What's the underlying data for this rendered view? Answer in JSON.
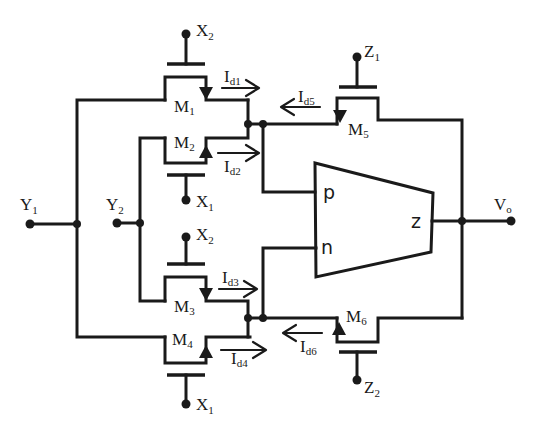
{
  "diagram": {
    "type": "circuit-schematic",
    "background": "#ffffff",
    "stroke_color": "#1a1a1a",
    "block": {
      "name": "Current Conveyor / OTA block",
      "ports": {
        "p": "p",
        "n": "n",
        "z": "z"
      }
    },
    "transistors": [
      {
        "id": "M1",
        "base": "M",
        "sub": "1",
        "gate": {
          "base": "X",
          "sub": "2"
        },
        "current": {
          "base": "I",
          "sub": "d1",
          "direction": "right"
        }
      },
      {
        "id": "M2",
        "base": "M",
        "sub": "2",
        "gate": {
          "base": "X",
          "sub": "1"
        },
        "current": {
          "base": "I",
          "sub": "d2",
          "direction": "right"
        }
      },
      {
        "id": "M3",
        "base": "M",
        "sub": "3",
        "gate": {
          "base": "X",
          "sub": "2"
        },
        "current": {
          "base": "I",
          "sub": "d3",
          "direction": "right"
        }
      },
      {
        "id": "M4",
        "base": "M",
        "sub": "4",
        "gate": {
          "base": "X",
          "sub": "1"
        },
        "current": {
          "base": "I",
          "sub": "d4",
          "direction": "right"
        }
      },
      {
        "id": "M5",
        "base": "M",
        "sub": "5",
        "gate": {
          "base": "Z",
          "sub": "1"
        },
        "current": {
          "base": "I",
          "sub": "d5",
          "direction": "left"
        }
      },
      {
        "id": "M6",
        "base": "M",
        "sub": "6",
        "gate": {
          "base": "Z",
          "sub": "2"
        },
        "current": {
          "base": "I",
          "sub": "d6",
          "direction": "left"
        }
      }
    ],
    "terminals": {
      "Y1": {
        "base": "Y",
        "sub": "1"
      },
      "Y2": {
        "base": "Y",
        "sub": "2"
      },
      "Vo": {
        "base": "V",
        "sub": "o"
      }
    }
  }
}
